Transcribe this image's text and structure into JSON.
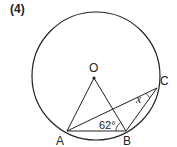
{
  "problem": {
    "number": "(4)"
  },
  "figure": {
    "circle": {
      "cx": 96,
      "cy": 76,
      "r": 64
    },
    "points": {
      "O": {
        "label": "O",
        "x": 94,
        "y": 78
      },
      "A": {
        "label": "A",
        "x": 67,
        "y": 131
      },
      "B": {
        "label": "B",
        "x": 126,
        "y": 131
      },
      "C": {
        "label": "C",
        "x": 157,
        "y": 88
      }
    },
    "segments": [
      "OA",
      "OB",
      "AB",
      "AC",
      "BC"
    ],
    "angles": {
      "ABO": {
        "label": "62°"
      },
      "ACB": {
        "label": "x"
      }
    },
    "stroke_color": "#222222"
  }
}
